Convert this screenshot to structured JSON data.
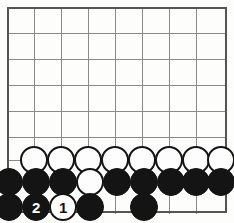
{
  "diagram": {
    "type": "go-board-problem",
    "board": {
      "columns": 8,
      "rows": 8,
      "origin_x": 7,
      "origin_y": 7,
      "spacing": 27,
      "border_color": "#555555",
      "line_color": "#8a8a8a",
      "background_color": "#fdfdfc",
      "border_width": 2.6,
      "line_width": 1.0
    },
    "stone_style": {
      "radius": 14,
      "black_color": "#141414",
      "white_color": "#fdfdfd",
      "white_outline_color": "#141414",
      "black_label_color": "#ffffff",
      "white_label_color": "#141414"
    },
    "stones": [
      {
        "name": "white-row-a1",
        "color": "white",
        "cx": 34,
        "cy": 160,
        "label": ""
      },
      {
        "name": "white-row-a2",
        "color": "white",
        "cx": 61,
        "cy": 160,
        "label": ""
      },
      {
        "name": "white-row-a3",
        "color": "white",
        "cx": 88,
        "cy": 160,
        "label": ""
      },
      {
        "name": "white-row-a4",
        "color": "white",
        "cx": 115,
        "cy": 160,
        "label": ""
      },
      {
        "name": "white-row-a5",
        "color": "white",
        "cx": 142,
        "cy": 160,
        "label": ""
      },
      {
        "name": "white-row-a6",
        "color": "white",
        "cx": 169,
        "cy": 160,
        "label": ""
      },
      {
        "name": "white-row-a7",
        "color": "white",
        "cx": 196,
        "cy": 160,
        "label": ""
      },
      {
        "name": "white-row-a8",
        "color": "white",
        "cx": 221,
        "cy": 160,
        "label": ""
      },
      {
        "name": "black-row-b1",
        "color": "black",
        "cx": 9,
        "cy": 182,
        "label": ""
      },
      {
        "name": "black-row-b2",
        "color": "black",
        "cx": 36,
        "cy": 182,
        "label": ""
      },
      {
        "name": "black-row-b3",
        "color": "black",
        "cx": 63,
        "cy": 182,
        "label": ""
      },
      {
        "name": "white-row-b4",
        "color": "white",
        "cx": 90,
        "cy": 182,
        "label": ""
      },
      {
        "name": "black-row-b5",
        "color": "black",
        "cx": 117,
        "cy": 182,
        "label": ""
      },
      {
        "name": "black-row-b6",
        "color": "black",
        "cx": 144,
        "cy": 182,
        "label": ""
      },
      {
        "name": "black-row-b7",
        "color": "black",
        "cx": 171,
        "cy": 182,
        "label": ""
      },
      {
        "name": "black-row-b8",
        "color": "black",
        "cx": 196,
        "cy": 182,
        "label": ""
      },
      {
        "name": "black-row-b9",
        "color": "black",
        "cx": 221,
        "cy": 182,
        "label": ""
      },
      {
        "name": "black-row-c1",
        "color": "black",
        "cx": 9,
        "cy": 207,
        "label": ""
      },
      {
        "name": "black-move-2",
        "color": "black",
        "cx": 36,
        "cy": 207,
        "label": "2"
      },
      {
        "name": "white-move-1",
        "color": "white",
        "cx": 63,
        "cy": 207,
        "label": "1"
      },
      {
        "name": "black-row-c4",
        "color": "black",
        "cx": 90,
        "cy": 207,
        "label": ""
      },
      {
        "name": "black-row-c6",
        "color": "black",
        "cx": 144,
        "cy": 207,
        "label": ""
      }
    ],
    "move_sequence": [
      {
        "number": "1",
        "color": "white"
      },
      {
        "number": "2",
        "color": "black"
      }
    ]
  }
}
